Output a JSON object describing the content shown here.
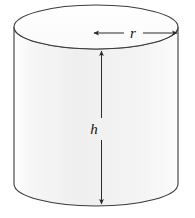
{
  "figure": {
    "name": "cylinder-diagram",
    "type": "geometric-solid",
    "shape": "right-circular-cylinder",
    "background_color": "#ffffff",
    "stroke_color": "#3a3a3a",
    "body_fill_color": "#f2f2f2",
    "top_face_fill_color": "#fbfbfb",
    "dimension_line_color": "#2b2b2b",
    "label_color": "#111111"
  },
  "labels": {
    "radius": "r",
    "height": "h"
  },
  "geometry": {
    "canvas_width": 195,
    "canvas_height": 218,
    "top_ellipse": {
      "cx": 96,
      "cy": 27,
      "rx": 82,
      "ry": 22
    },
    "body_height": 156,
    "bottom_arc_depth": 22,
    "left_wall_x": 14,
    "right_wall_x": 178,
    "body_top_y": 27,
    "body_bottom_y": 184
  },
  "dimensions": {
    "radius_arrow": {
      "name": "radius",
      "orientation": "horizontal",
      "y": 33,
      "x_start": 94,
      "x_end": 178,
      "label_x": 133,
      "label_y": 38,
      "arrowheads": "both",
      "label": "r"
    },
    "height_arrow": {
      "name": "height",
      "orientation": "vertical",
      "x": 101,
      "y_start": 50,
      "y_end": 205,
      "label_x": 93,
      "label_y": 134,
      "gap_top": 116,
      "gap_bottom": 140,
      "arrowheads": "both",
      "label": "h"
    }
  }
}
